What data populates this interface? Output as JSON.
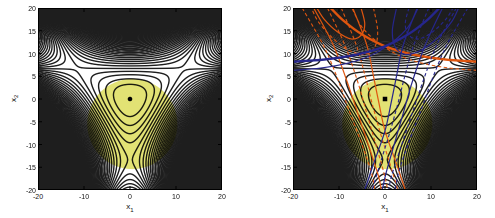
{
  "figure": {
    "background_color": "#ffffff",
    "plots": [
      {
        "id": "left",
        "xlabel": {
          "base": "x",
          "sub": "1"
        },
        "ylabel": {
          "base": "x",
          "sub": "2"
        },
        "xlim": [
          -20,
          20
        ],
        "ylim": [
          -20,
          20
        ],
        "xticks": [
          -20,
          -10,
          0,
          10,
          20
        ],
        "yticks": [
          -20,
          -15,
          -10,
          -5,
          0,
          5,
          10,
          15,
          20
        ],
        "marker": {
          "shape": "dot",
          "x": 0,
          "y": 0,
          "color": "#000000"
        },
        "show_curve_families": false
      },
      {
        "id": "right",
        "xlabel": {
          "base": "x",
          "sub": "1"
        },
        "ylabel": {
          "base": "x",
          "sub": "2"
        },
        "xlim": [
          -20,
          20
        ],
        "ylim": [
          -20,
          20
        ],
        "xticks": [
          -20,
          -10,
          0,
          10,
          20
        ],
        "yticks": [
          -20,
          -15,
          -10,
          -5,
          0,
          5,
          10,
          15,
          20
        ],
        "marker": {
          "shape": "square",
          "x": 0,
          "y": 0,
          "color": "#000000"
        },
        "show_curve_families": true
      }
    ]
  },
  "chart_data": {
    "type": "contour",
    "xlabel": "x1",
    "ylabel": "x2",
    "xlim": [
      -20,
      20
    ],
    "ylim": [
      -20,
      20
    ],
    "grid": false,
    "legend": "none",
    "background_contours": {
      "formula": "f(x1,x2) = (x1^2 + x2^2)/2 + c*(x2^3 - 3*x1^2*x2)",
      "c": 0.025,
      "level_step": 6,
      "line_value": 30,
      "minimum": [
        0,
        0
      ],
      "saddle_points": [
        [
          0,
          -13.3
        ],
        [
          -11.5,
          6.7
        ],
        [
          11.5,
          6.7
        ]
      ]
    },
    "shaded_region": {
      "shape": "circle",
      "center": [
        0.5,
        -5.5
      ],
      "radius": 9.8,
      "color": "#e2e274",
      "blend": "multiply",
      "plots": [
        "left",
        "right"
      ]
    },
    "markers": [
      {
        "plot": "left",
        "shape": "dot",
        "x": 0,
        "y": 0
      },
      {
        "plot": "right",
        "shape": "square",
        "x": 0,
        "y": 0
      }
    ],
    "series": [
      {
        "name": "orange-curve-family",
        "plot": "right",
        "color": "#e0560f",
        "curves": [
          {
            "style": "solid",
            "width": 2.4,
            "points": [
              [
                20,
                8.2
              ],
              [
                13,
                8.7
              ],
              [
                6,
                9.8
              ],
              [
                0,
                11.6
              ],
              [
                -5,
                14.2
              ],
              [
                -9,
                17.2
              ],
              [
                -11.8,
                20
              ]
            ]
          },
          {
            "style": "dashed",
            "width": 1.1,
            "points": [
              [
                20,
                6.3
              ],
              [
                14,
                6.8
              ],
              [
                8,
                7.9
              ],
              [
                3,
                9.6
              ],
              [
                -1.5,
                12.4
              ],
              [
                -5,
                15.8
              ],
              [
                -7.2,
                20
              ]
            ]
          },
          {
            "style": "solid",
            "width": 1.2,
            "points": [
              [
                -7,
                20
              ],
              [
                -4,
                12
              ],
              [
                -2.5,
                5
              ],
              [
                -1.3,
                -1
              ],
              [
                0,
                -7
              ],
              [
                2.4,
                -14
              ],
              [
                4.4,
                -20
              ]
            ]
          },
          {
            "style": "dashed",
            "width": 1.1,
            "points": [
              [
                -9.5,
                20
              ],
              [
                -6.3,
                12
              ],
              [
                -4.3,
                5
              ],
              [
                -2.8,
                -1
              ],
              [
                -1,
                -7.5
              ],
              [
                1,
                -14
              ],
              [
                2.8,
                -20
              ]
            ]
          },
          {
            "style": "dashed",
            "width": 1.1,
            "points": [
              [
                -12.5,
                20
              ],
              [
                -8.8,
                12
              ],
              [
                -6,
                4
              ],
              [
                -4,
                -3
              ],
              [
                -2,
                -10
              ],
              [
                -0.3,
                -16
              ],
              [
                0.6,
                -20
              ]
            ]
          },
          {
            "style": "solid",
            "width": 1.2,
            "points": [
              [
                -15.5,
                20
              ],
              [
                -11.3,
                12
              ],
              [
                -8.3,
                4
              ],
              [
                -5.8,
                -3.5
              ],
              [
                -3.3,
                -11
              ],
              [
                -1.4,
                -17
              ],
              [
                -0.8,
                -20
              ]
            ]
          },
          {
            "style": "dashed",
            "width": 1.1,
            "points": [
              [
                -2.5,
                20
              ],
              [
                -1.6,
                15
              ],
              [
                -2.2,
                11.5
              ],
              [
                -4.5,
                9.8
              ],
              [
                -8,
                10.8
              ],
              [
                -11.5,
                13.5
              ],
              [
                -14.5,
                17
              ],
              [
                -16,
                20
              ]
            ]
          },
          {
            "style": "solid",
            "width": 1.2,
            "points": [
              [
                -5.2,
                20
              ],
              [
                -4.4,
                16.5
              ],
              [
                -5.2,
                14
              ],
              [
                -7.4,
                13.2
              ],
              [
                -10.4,
                14.8
              ],
              [
                -13.2,
                17.5
              ],
              [
                -14.8,
                20
              ]
            ]
          },
          {
            "style": "dashed",
            "width": 1.1,
            "points": [
              [
                -18,
                20
              ],
              [
                -13.5,
                12
              ],
              [
                -10.5,
                5
              ],
              [
                -8,
                -2
              ],
              [
                -5,
                -10
              ],
              [
                -3,
                -16
              ],
              [
                -2.2,
                -20
              ]
            ]
          }
        ]
      },
      {
        "name": "blue-curve-family",
        "plot": "right",
        "color": "#26268c",
        "curves": [
          {
            "style": "solid",
            "width": 2.4,
            "points": [
              [
                -20,
                8.2
              ],
              [
                -13,
                8.7
              ],
              [
                -6,
                9.8
              ],
              [
                0,
                11.6
              ],
              [
                5,
                14.2
              ],
              [
                9,
                17.2
              ],
              [
                11.8,
                20
              ]
            ]
          },
          {
            "style": "solid",
            "width": 1.1,
            "points": [
              [
                -20,
                6.3
              ],
              [
                -14,
                6.8
              ],
              [
                -8,
                7.9
              ],
              [
                -3,
                9.6
              ],
              [
                1.5,
                12.4
              ],
              [
                5,
                15.8
              ],
              [
                7.2,
                20
              ]
            ]
          },
          {
            "style": "solid",
            "width": 1.2,
            "points": [
              [
                7,
                20
              ],
              [
                4,
                12
              ],
              [
                2.5,
                5
              ],
              [
                1.3,
                -1
              ],
              [
                0,
                -7
              ],
              [
                -2.4,
                -14
              ],
              [
                -4.4,
                -20
              ]
            ]
          },
          {
            "style": "dashed",
            "width": 1.1,
            "points": [
              [
                9.5,
                20
              ],
              [
                6.3,
                12
              ],
              [
                4.3,
                5
              ],
              [
                2.8,
                -1
              ],
              [
                1,
                -7.5
              ],
              [
                -1,
                -14
              ],
              [
                -2.8,
                -20
              ]
            ]
          },
          {
            "style": "solid",
            "width": 1.2,
            "points": [
              [
                12.5,
                20
              ],
              [
                8.8,
                12
              ],
              [
                6,
                4
              ],
              [
                4,
                -3
              ],
              [
                2,
                -10
              ],
              [
                0.3,
                -16
              ],
              [
                -0.6,
                -20
              ]
            ]
          },
          {
            "style": "dashed",
            "width": 1.1,
            "points": [
              [
                15.5,
                20
              ],
              [
                11.3,
                12
              ],
              [
                8.3,
                4
              ],
              [
                5.8,
                -3.5
              ],
              [
                3.3,
                -11
              ],
              [
                1.4,
                -17
              ],
              [
                0.8,
                -20
              ]
            ]
          },
          {
            "style": "solid",
            "width": 1.2,
            "points": [
              [
                2.5,
                20
              ],
              [
                1.6,
                15
              ],
              [
                2.2,
                11.5
              ],
              [
                4.5,
                9.8
              ],
              [
                8,
                10.8
              ],
              [
                11.5,
                13.5
              ],
              [
                14.5,
                17
              ],
              [
                16,
                20
              ]
            ]
          },
          {
            "style": "dashed",
            "width": 1.1,
            "points": [
              [
                5.2,
                20
              ],
              [
                4.4,
                16.5
              ],
              [
                5.2,
                14
              ],
              [
                7.4,
                13.2
              ],
              [
                10.4,
                14.8
              ],
              [
                13.2,
                17.5
              ],
              [
                14.8,
                20
              ]
            ]
          },
          {
            "style": "dashed",
            "width": 1.1,
            "points": [
              [
                18,
                20
              ],
              [
                13.5,
                12
              ],
              [
                10.5,
                5
              ],
              [
                8,
                -2
              ],
              [
                5,
                -10
              ],
              [
                3,
                -16
              ],
              [
                2.2,
                -20
              ]
            ]
          }
        ]
      }
    ]
  }
}
